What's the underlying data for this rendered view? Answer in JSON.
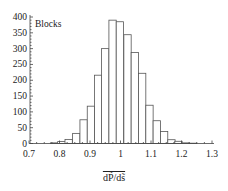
{
  "chart_data": {
    "type": "bar",
    "subtype": "histogram",
    "title": "",
    "series_label": "Blocks",
    "xlabel": "dP̃/ds̃ (overlined)",
    "xlabel_text": "dP̃/ds̃",
    "ylabel": "",
    "xlim": [
      0.7,
      1.3
    ],
    "ylim": [
      0,
      400
    ],
    "xticks": [
      0.7,
      0.8,
      0.9,
      1,
      1.1,
      1.2,
      1.3
    ],
    "xtick_labels": [
      "0.7",
      "0.8",
      "0.9",
      "1",
      "1.1",
      "1.2",
      "1.3"
    ],
    "yticks": [
      0,
      50,
      100,
      150,
      200,
      250,
      300,
      350,
      400
    ],
    "ytick_labels": [
      "0",
      "50",
      "100",
      "150",
      "200",
      "250",
      "300",
      "350",
      "400"
    ],
    "bin_width": 0.024,
    "bin_centers": [
      0.782,
      0.806,
      0.83,
      0.855,
      0.879,
      0.903,
      0.927,
      0.95,
      0.974,
      0.998,
      1.023,
      1.047,
      1.071,
      1.095,
      1.119,
      1.143,
      1.167,
      1.19,
      1.214,
      1.238
    ],
    "values": [
      2,
      6,
      13,
      32,
      75,
      118,
      216,
      300,
      390,
      385,
      344,
      288,
      222,
      121,
      72,
      38,
      12,
      7,
      2,
      1
    ],
    "grid": false,
    "legend": "none",
    "bar_fill": "#ffffff",
    "bar_stroke": "#555555"
  }
}
